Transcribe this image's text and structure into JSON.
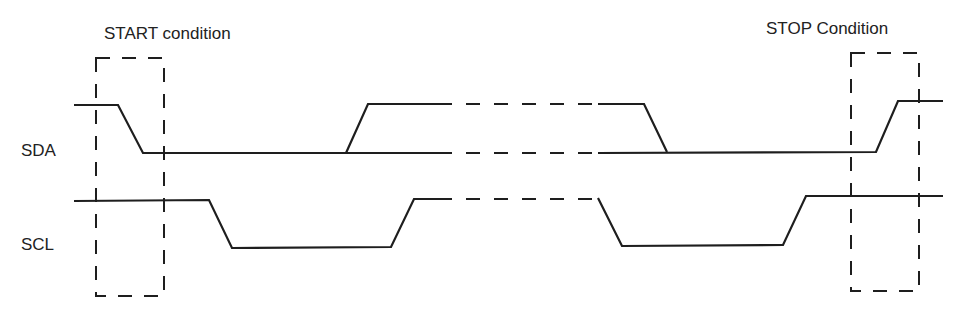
{
  "diagram": {
    "type": "timing-diagram",
    "annotations": {
      "start": "START condition",
      "stop": "STOP Condition"
    },
    "signals": [
      {
        "name": "SDA",
        "label": "SDA"
      },
      {
        "name": "SCL",
        "label": "SCL"
      }
    ],
    "colors": {
      "line": "#1e1e1e",
      "background": "#ffffff",
      "text": "#222222"
    }
  }
}
